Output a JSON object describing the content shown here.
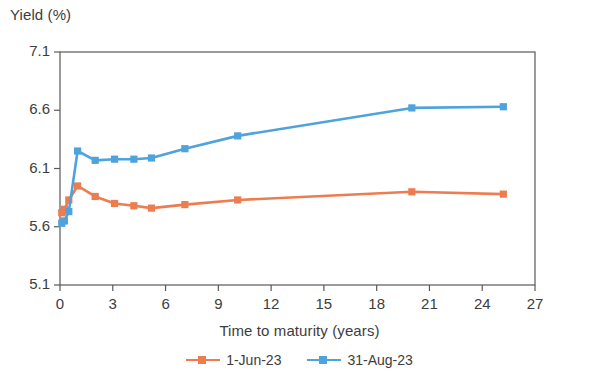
{
  "chart_data": {
    "type": "line",
    "title": "",
    "ylabel": "Yield (%)",
    "xlabel": "Time to maturity (years)",
    "xlim": [
      0,
      27
    ],
    "ylim": [
      5.1,
      7.1
    ],
    "xticks": [
      "0",
      "3",
      "6",
      "9",
      "12",
      "15",
      "18",
      "21",
      "24",
      "27"
    ],
    "yticks": [
      "5.1",
      "5.6",
      "6.1",
      "6.6",
      "7.1"
    ],
    "grid": false,
    "legend_position": "bottom-center",
    "x": [
      0.1,
      0.25,
      0.5,
      1.0,
      2.0,
      3.1,
      4.2,
      5.2,
      7.1,
      10.1,
      20.0,
      25.2
    ],
    "series": [
      {
        "name": "1-Jun-23",
        "color": "#ED7D50",
        "marker": "square",
        "values": [
          5.72,
          5.75,
          5.83,
          5.95,
          5.86,
          5.8,
          5.78,
          5.76,
          5.79,
          5.83,
          5.9,
          5.88
        ]
      },
      {
        "name": "31-Aug-23",
        "color": "#4FA3DC",
        "marker": "square",
        "values": [
          5.63,
          5.65,
          5.73,
          6.25,
          6.17,
          6.18,
          6.18,
          6.19,
          6.27,
          6.38,
          6.62,
          6.63
        ]
      }
    ]
  },
  "axis": {
    "y_title": "Yield (%)",
    "x_title": "Time to maturity (years)"
  },
  "legend": {
    "items": [
      {
        "label": "1-Jun-23",
        "color": "#ED7D50"
      },
      {
        "label": "31-Aug-23",
        "color": "#4FA3DC"
      }
    ]
  },
  "colors": {
    "series_1": "#ED7D50",
    "series_2": "#4FA3DC",
    "axis": "#595959",
    "text": "#3d3d3d"
  }
}
